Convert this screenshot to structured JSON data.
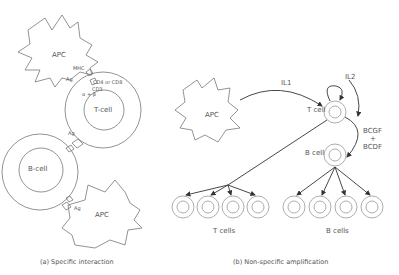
{
  "panel_a": {
    "caption": "(a) Specific interaction",
    "apc_top": "APC",
    "mhc": "MHC",
    "ag_top": "Ag",
    "cd": "CD4 or CD8",
    "cd3": "CD3",
    "ab": "α + β",
    "tcell": "T-cell",
    "ag_mid": "Ag",
    "bcell": "B-cell",
    "ag_bottom": "Ag",
    "apc_bottom": "APC"
  },
  "panel_b": {
    "caption": "(b) Non-specific amplification",
    "apc": "APC",
    "il1": "IL1",
    "il2": "IL2",
    "tcell": "T cell",
    "bcell": "B cell",
    "bcgf": "BCGF",
    "plus": "+",
    "bcdf": "BCDF",
    "tcells": "T cells",
    "bcells": "B cells"
  }
}
